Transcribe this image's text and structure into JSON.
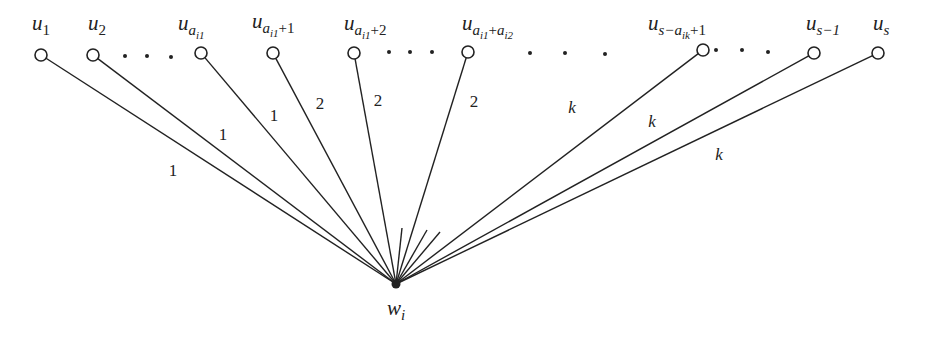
{
  "diagram": {
    "center": {
      "id": "w_i",
      "label": "w",
      "sub": "i",
      "x": 396,
      "y": 284
    },
    "nodes": [
      {
        "id": "u1",
        "label": "u",
        "sub": "1",
        "x": 41,
        "y": 55,
        "lx": 32,
        "ly": 30
      },
      {
        "id": "u2",
        "label": "u",
        "sub": "2",
        "x": 93,
        "y": 55,
        "lx": 88,
        "ly": 30
      },
      {
        "id": "ua_i1",
        "label": "u",
        "sub": "a",
        "subsub": "i1",
        "x": 201,
        "y": 53,
        "lx": 178,
        "ly": 30
      },
      {
        "id": "ua_i1_plus_1",
        "label": "u",
        "sub": "a",
        "subsub": "i1",
        "tail": "+1",
        "x": 273,
        "y": 53,
        "lx": 252,
        "ly": 28
      },
      {
        "id": "ua_i1_plus_2",
        "label": "u",
        "sub": "a",
        "subsub": "i1",
        "tail": "+2",
        "x": 354,
        "y": 53,
        "lx": 344,
        "ly": 30
      },
      {
        "id": "ua_i1_plus_a_i2",
        "label": "u",
        "sub": "a",
        "subsub": "i1",
        "tail": "+a",
        "tailsub": "i2",
        "x": 468,
        "y": 52,
        "lx": 462,
        "ly": 30
      },
      {
        "id": "u_s_minus_a_ik_plus_1",
        "label": "u",
        "sub": "s−a",
        "subsub": "ik",
        "tail": "+1",
        "x": 703,
        "y": 50,
        "lx": 648,
        "ly": 30
      },
      {
        "id": "u_s_minus_1",
        "label": "u",
        "sub": "s−1",
        "x": 814,
        "y": 53,
        "lx": 806,
        "ly": 30
      },
      {
        "id": "u_s",
        "label": "u",
        "sub": "s",
        "x": 878,
        "y": 53,
        "lx": 873,
        "ly": 30
      }
    ],
    "stubs": [
      {
        "x": 402,
        "y": 228
      },
      {
        "x": 427,
        "y": 230
      },
      {
        "x": 440,
        "y": 232
      }
    ],
    "ellipses": [
      {
        "dots": [
          [
            125,
            56
          ],
          [
            147,
            56
          ],
          [
            171,
            57
          ]
        ]
      },
      {
        "dots": [
          [
            389,
            52
          ],
          [
            410,
            52
          ],
          [
            432,
            52
          ]
        ]
      },
      {
        "dots": [
          [
            530,
            53
          ],
          [
            565,
            53
          ],
          [
            605,
            54
          ]
        ]
      },
      {
        "dots": [
          [
            716,
            50
          ],
          [
            742,
            50
          ],
          [
            768,
            52
          ]
        ]
      }
    ],
    "edge_labels": [
      {
        "text": "1",
        "x": 173,
        "y": 176,
        "italic": false
      },
      {
        "text": "1",
        "x": 223,
        "y": 140,
        "italic": false
      },
      {
        "text": "1",
        "x": 274,
        "y": 121,
        "italic": false
      },
      {
        "text": "2",
        "x": 320,
        "y": 109,
        "italic": false
      },
      {
        "text": "2",
        "x": 378,
        "y": 106,
        "italic": false
      },
      {
        "text": "2",
        "x": 474,
        "y": 107,
        "italic": false
      },
      {
        "text": "k",
        "x": 572,
        "y": 113,
        "italic": true
      },
      {
        "text": "k",
        "x": 652,
        "y": 127,
        "italic": true
      },
      {
        "text": "k",
        "x": 719,
        "y": 160,
        "italic": true
      }
    ],
    "colors": {
      "line": "#222222",
      "node_fill": "#ffffff",
      "background": "#ffffff"
    }
  }
}
